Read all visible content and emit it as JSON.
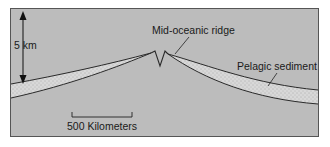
{
  "diagram": {
    "labels": {
      "depth": "5 km",
      "ridge": "Mid-oceanic ridge",
      "sediment": "Pelagic sediment",
      "scale": "500 Kilometers"
    },
    "colors": {
      "background": "#bdbdbd",
      "sediment": "#dcdcdc",
      "line": "#2a2a2a",
      "frame": "#555555"
    }
  }
}
